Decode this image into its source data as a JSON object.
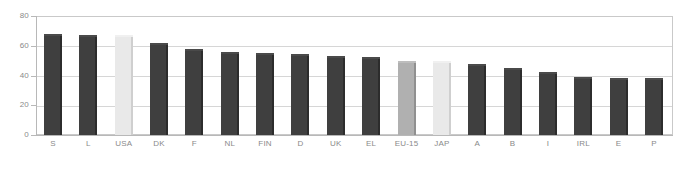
{
  "chart_data": {
    "type": "bar",
    "title": "",
    "xlabel": "",
    "ylabel": "",
    "ylim": [
      0,
      80
    ],
    "yticks": [
      0,
      20,
      40,
      60,
      80
    ],
    "grid": true,
    "legend": "none",
    "categories": [
      "S",
      "L",
      "USA",
      "DK",
      "F",
      "NL",
      "FIN",
      "D",
      "UK",
      "EL",
      "EU-15",
      "JAP",
      "A",
      "B",
      "I",
      "IRL",
      "E",
      "P"
    ],
    "values": [
      68,
      67.5,
      67,
      62,
      57.5,
      56,
      55,
      54.5,
      53,
      52.5,
      50,
      49.5,
      48,
      45,
      42.5,
      39,
      38.5,
      38.5
    ],
    "series": [
      {
        "name": "Employment rate",
        "values": [
          68,
          67.5,
          67,
          62,
          57.5,
          56,
          55,
          54.5,
          53,
          52.5,
          50,
          49.5,
          48,
          45,
          42.5,
          39,
          38.5,
          38.5
        ]
      }
    ],
    "bar_colors": [
      "dark",
      "dark",
      "light",
      "dark",
      "dark",
      "dark",
      "dark",
      "dark",
      "dark",
      "dark",
      "medium",
      "light",
      "dark",
      "dark",
      "dark",
      "dark",
      "dark",
      "dark"
    ],
    "ytick_labels": [
      "0",
      "20",
      "40",
      "60",
      "80"
    ]
  },
  "style": {
    "bar_dark": "#3f3f3f",
    "bar_dark_edge": "#2c2c2c",
    "bar_dark_cap": "#4a4a4a",
    "bar_medium": "#b0b0b0",
    "bar_medium_edge": "#909090",
    "bar_medium_cap": "#bdbdbd",
    "bar_light": "#e9e9e9",
    "bar_light_edge": "#cfcfcf",
    "bar_light_cap": "#f0f0f0",
    "axis_color": "#b8b8b8",
    "grid_color": "#d6d6d6",
    "text_color": "#8a8a8a",
    "plot_border": "#c9c9c9",
    "background": "#ffffff"
  }
}
